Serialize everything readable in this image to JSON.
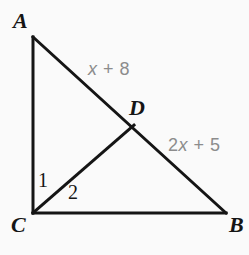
{
  "figure": {
    "background_color": "#fafafa",
    "stroke_color": "#151515",
    "expression_color": "#8c8c8c",
    "stroke_width": 3,
    "vertices": {
      "A": {
        "label": "A",
        "x": 33,
        "y": 37
      },
      "B": {
        "label": "B",
        "x": 226,
        "y": 213
      },
      "C": {
        "label": "C",
        "x": 33,
        "y": 213
      },
      "D": {
        "label": "D",
        "x": 133,
        "y": 126
      }
    },
    "segments": [
      {
        "name": "segment-AC",
        "from": "A",
        "to": "C"
      },
      {
        "name": "segment-CB",
        "from": "C",
        "to": "B"
      },
      {
        "name": "segment-AB",
        "from": "A",
        "to": "B"
      },
      {
        "name": "segment-CD",
        "from": "C",
        "to": "D"
      }
    ],
    "angles": [
      {
        "name": "angle-1",
        "label": "1",
        "vertex": "C",
        "between": [
          "CA",
          "CD"
        ]
      },
      {
        "name": "angle-2",
        "label": "2",
        "vertex": "C",
        "between": [
          "CD",
          "CB"
        ]
      }
    ],
    "side_expressions": [
      {
        "name": "segment-AD-length",
        "segment": "AD",
        "text": "x + 8",
        "variable": "x",
        "rest": " + 8"
      },
      {
        "name": "segment-DB-length",
        "segment": "DB",
        "text": "2x + 5",
        "prefix": "2",
        "variable": "x",
        "rest": " + 5"
      }
    ]
  },
  "labels": {
    "A": "A",
    "B": "B",
    "C": "C",
    "D": "D",
    "angle_1": "1",
    "angle_2": "2",
    "expr_ad_prefix": "",
    "expr_ad_var": "x",
    "expr_ad_rest": " + 8",
    "expr_db_prefix": "2",
    "expr_db_var": "x",
    "expr_db_rest": " + 5"
  }
}
